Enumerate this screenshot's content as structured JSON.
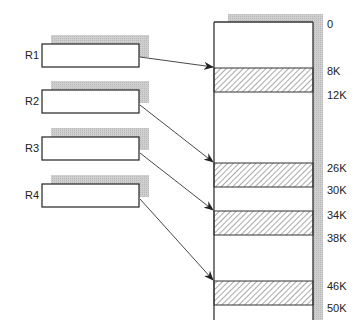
{
  "registers": [
    {
      "label": "R1"
    },
    {
      "label": "R2"
    },
    {
      "label": "R3"
    },
    {
      "label": "R4"
    }
  ],
  "memory_addresses": [
    "0",
    "8K",
    "12K",
    "26K",
    "30K",
    "34K",
    "38K",
    "46K",
    "50K"
  ],
  "colors": {
    "shadow": "#c8c8c8",
    "line": "#333333",
    "hatch": "#555555"
  }
}
